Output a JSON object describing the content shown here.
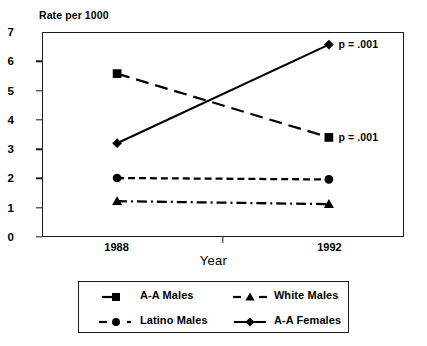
{
  "chart_data": {
    "type": "line",
    "title": "",
    "ylabel": "Rate per 1000",
    "xlabel": "Year",
    "categories": [
      "1988",
      "1992"
    ],
    "x": [
      1988,
      1992
    ],
    "xlim": [
      1986.6,
      1993.4
    ],
    "ylim": [
      0,
      7
    ],
    "yticks": [
      "0",
      "1",
      "2",
      "3",
      "4",
      "5",
      "6",
      "7"
    ],
    "ytick_values": [
      0,
      1,
      2,
      3,
      4,
      5,
      6,
      7
    ],
    "grid": false,
    "legend_position": "bottom",
    "series": [
      {
        "name": "A-A Males",
        "values": [
          5.6,
          3.4
        ],
        "marker": "square",
        "linestyle": "long-dash",
        "color": "#000000",
        "annotation": "p = .001"
      },
      {
        "name": "White Males",
        "values": [
          1.2,
          1.1
        ],
        "marker": "triangle",
        "linestyle": "dash-dot",
        "color": "#000000",
        "annotation": ""
      },
      {
        "name": "Latino Males",
        "values": [
          2.0,
          1.95
        ],
        "marker": "circle",
        "linestyle": "dashed",
        "color": "#000000",
        "annotation": ""
      },
      {
        "name": "A-A Females",
        "values": [
          3.2,
          6.6
        ],
        "marker": "diamond",
        "linestyle": "solid",
        "color": "#000000",
        "annotation": "p = .001"
      }
    ],
    "annotations": [
      {
        "text": "p = .001",
        "series": "A-A Females",
        "x": 1992,
        "y": 6.6
      },
      {
        "text": "p = .001",
        "series": "A-A Males",
        "x": 1992,
        "y": 3.4
      }
    ]
  },
  "legend": {
    "rows": [
      [
        {
          "label": "A-A Males",
          "marker": "square",
          "linestyle": "short-dash-right"
        },
        {
          "label": "White Males",
          "marker": "triangle",
          "linestyle": "dash-marker-dash"
        }
      ],
      [
        {
          "label": "Latino Males",
          "marker": "circle",
          "linestyle": "dash-marker-dot"
        },
        {
          "label": "A-A Females",
          "marker": "diamond",
          "linestyle": "solid"
        }
      ]
    ]
  },
  "colors": {
    "ink": "#1a1a1a",
    "background": "#ffffff",
    "series": "#000000"
  }
}
